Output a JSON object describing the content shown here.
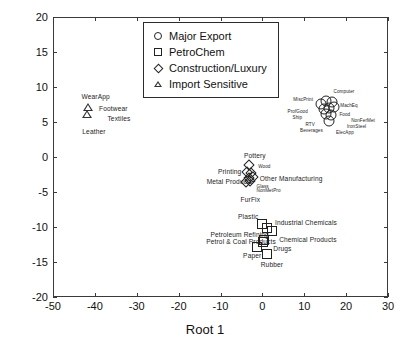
{
  "chart_data": {
    "type": "scatter",
    "title": "",
    "xlabel": "Root 1",
    "ylabel": "Root 2",
    "xlim": [
      -50,
      30
    ],
    "ylim": [
      -20,
      20
    ],
    "xticks": [
      -50,
      -40,
      -30,
      -20,
      -10,
      0,
      10,
      20,
      30
    ],
    "yticks": [
      -20,
      -15,
      -10,
      -5,
      0,
      5,
      10,
      15,
      20
    ],
    "xtick_labels": [
      "-50",
      "-40",
      "-30",
      "-20",
      "-10",
      "0",
      "10",
      "20",
      "30"
    ],
    "ytick_labels": [
      "-20",
      "-15",
      "-10",
      "-5",
      "0",
      "5",
      "10",
      "15",
      "20"
    ],
    "grid": false,
    "legend_position": "upper center",
    "legend": [
      {
        "label": "Major Export",
        "marker": "circle"
      },
      {
        "label": "PetroChem",
        "marker": "square"
      },
      {
        "label": "Construction/Luxury",
        "marker": "diamond"
      },
      {
        "label": "Import Sensitive",
        "marker": "triangle"
      }
    ],
    "series": [
      {
        "name": "Major Export",
        "marker": "circle",
        "points": [
          {
            "x": 14.0,
            "y": 7.6
          },
          {
            "x": 15.3,
            "y": 8.0
          },
          {
            "x": 16.6,
            "y": 7.9
          },
          {
            "x": 14.6,
            "y": 6.9
          },
          {
            "x": 15.9,
            "y": 7.0
          },
          {
            "x": 17.2,
            "y": 7.1
          },
          {
            "x": 15.2,
            "y": 6.1
          },
          {
            "x": 16.5,
            "y": 6.0
          },
          {
            "x": 16.0,
            "y": 5.2
          }
        ]
      },
      {
        "name": "PetroChem",
        "marker": "square",
        "points": [
          {
            "x": -0.2,
            "y": -9.6
          },
          {
            "x": 1.0,
            "y": -10.1
          },
          {
            "x": 2.2,
            "y": -10.6
          },
          {
            "x": 0.4,
            "y": -11.8
          },
          {
            "x": 0.2,
            "y": -12.2
          },
          {
            "x": -1.4,
            "y": -12.8
          },
          {
            "x": 1.1,
            "y": -13.8
          }
        ]
      },
      {
        "name": "Construction/Luxury",
        "marker": "diamond",
        "points": [
          {
            "x": -3.2,
            "y": -1.2
          },
          {
            "x": -3.6,
            "y": -2.1
          },
          {
            "x": -2.7,
            "y": -2.3
          },
          {
            "x": -3.3,
            "y": -3.0
          },
          {
            "x": -2.3,
            "y": -2.9
          },
          {
            "x": -3.9,
            "y": -3.5
          },
          {
            "x": -2.9,
            "y": -3.4
          }
        ]
      },
      {
        "name": "Import Sensitive",
        "marker": "triangle",
        "points": [
          {
            "x": -41.7,
            "y": 7.1
          },
          {
            "x": -41.9,
            "y": 6.1
          }
        ]
      }
    ],
    "annotations": [
      {
        "text": "WearApp",
        "x": -43.2,
        "y": 8.6,
        "size": "big",
        "anchor": "start"
      },
      {
        "text": "Footwear",
        "x": -39.0,
        "y": 6.9,
        "size": "big",
        "anchor": "start"
      },
      {
        "text": "Textiles",
        "x": -37.0,
        "y": 5.5,
        "size": "big",
        "anchor": "start"
      },
      {
        "text": "Leather",
        "x": -43.0,
        "y": 3.6,
        "size": "big",
        "anchor": "start"
      },
      {
        "text": "MiscPrint",
        "x": 7.4,
        "y": 8.0,
        "size": "small",
        "anchor": "start"
      },
      {
        "text": "ProfGood",
        "x": 6.0,
        "y": 6.3,
        "size": "small",
        "anchor": "start"
      },
      {
        "text": "Ship",
        "x": 7.2,
        "y": 5.4,
        "size": "small",
        "anchor": "start"
      },
      {
        "text": "RTV",
        "x": 10.3,
        "y": 4.5,
        "size": "small",
        "anchor": "start"
      },
      {
        "text": "Beverages",
        "x": 9.0,
        "y": 3.6,
        "size": "small",
        "anchor": "start"
      },
      {
        "text": "Computer",
        "x": 17.0,
        "y": 9.1,
        "size": "small",
        "anchor": "start"
      },
      {
        "text": "MachEq",
        "x": 18.6,
        "y": 7.2,
        "size": "small",
        "anchor": "start"
      },
      {
        "text": "Food",
        "x": 18.4,
        "y": 5.9,
        "size": "small",
        "anchor": "start"
      },
      {
        "text": "NonFerMet",
        "x": 21.2,
        "y": 5.0,
        "size": "small",
        "anchor": "start"
      },
      {
        "text": "IronSteel",
        "x": 20.2,
        "y": 4.2,
        "size": "small",
        "anchor": "start"
      },
      {
        "text": "ElecApp",
        "x": 17.6,
        "y": 3.3,
        "size": "small",
        "anchor": "start"
      },
      {
        "text": "Pottery",
        "x": -4.4,
        "y": 0.1,
        "size": "big",
        "anchor": "start"
      },
      {
        "text": "Printing",
        "x": -10.6,
        "y": -2.1,
        "size": "big",
        "anchor": "start"
      },
      {
        "text": "Metal Products",
        "x": -13.3,
        "y": -3.6,
        "size": "big",
        "anchor": "start"
      },
      {
        "text": "Wood",
        "x": -1.0,
        "y": -1.5,
        "size": "small",
        "anchor": "start"
      },
      {
        "text": "Other Manufacturing",
        "x": -0.6,
        "y": -3.2,
        "size": "big",
        "anchor": "start"
      },
      {
        "text": "Glass",
        "x": -1.4,
        "y": -4.4,
        "size": "small",
        "anchor": "start"
      },
      {
        "text": "NonMetPro",
        "x": -1.4,
        "y": -5.0,
        "size": "small",
        "anchor": "start"
      },
      {
        "text": "FurFix",
        "x": -5.2,
        "y": -6.1,
        "size": "big",
        "anchor": "start"
      },
      {
        "text": "Plastic",
        "x": -5.8,
        "y": -8.5,
        "size": "big",
        "anchor": "start"
      },
      {
        "text": "Industrial Chemicals",
        "x": 3.0,
        "y": -9.4,
        "size": "big",
        "anchor": "start"
      },
      {
        "text": "Petroleum Refining",
        "x": -12.4,
        "y": -11.2,
        "size": "big",
        "anchor": "start"
      },
      {
        "text": "Petrol & Coal Products",
        "x": -13.4,
        "y": -12.2,
        "size": "big",
        "anchor": "start"
      },
      {
        "text": "Chemical Products",
        "x": 4.0,
        "y": -11.8,
        "size": "big",
        "anchor": "start"
      },
      {
        "text": "Drugs",
        "x": 2.6,
        "y": -13.2,
        "size": "big",
        "anchor": "start"
      },
      {
        "text": "Paper",
        "x": -4.6,
        "y": -14.2,
        "size": "big",
        "anchor": "start"
      },
      {
        "text": "Rubber",
        "x": -0.4,
        "y": -15.4,
        "size": "big",
        "anchor": "start"
      }
    ]
  }
}
